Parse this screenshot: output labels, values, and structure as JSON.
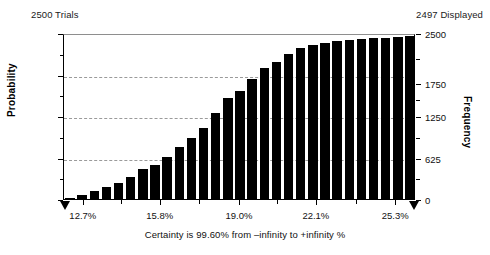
{
  "header": {
    "trials_label": "2500 Trials",
    "displayed_label": "2497 Displayed"
  },
  "axis_titles": {
    "left": "Probability",
    "right": "Frequency",
    "bottom": "Certainty is 99.60% from –infinity to +infinity %"
  },
  "chart_data": {
    "type": "bar",
    "title": "",
    "subtitle": "",
    "xlabel": "Certainty is 99.60% from –infinity to +infinity %",
    "ylabel": "Probability",
    "y2label": "Frequency",
    "grid": true,
    "legend": "none",
    "trials": 2500,
    "displayed": 2497,
    "certainty_percent": 99.6,
    "certainty_range": [
      "–infinity",
      "+infinity"
    ],
    "xlim": [
      11.9,
      26.1
    ],
    "xtick_labels": [
      "12.7%",
      "15.8%",
      "19.0%",
      "22.1%",
      "25.3%"
    ],
    "xtick_values": [
      12.7,
      15.8,
      19.0,
      22.1,
      25.3
    ],
    "ylim": [
      0.0,
      1.0
    ],
    "ytick_labels": [
      "0.000",
      "0.250",
      "0.500",
      "0.750",
      "1.000"
    ],
    "ytick_values": [
      0.0,
      0.25,
      0.5,
      0.75,
      1.0
    ],
    "y2lim": [
      0,
      2500
    ],
    "y2tick_labels": [
      "0",
      "625",
      "1250",
      "1750",
      "2500"
    ],
    "y2tick_values": [
      0,
      625,
      1250,
      1750,
      2500
    ],
    "categories": [
      "12.23%",
      "12.70%",
      "13.17%",
      "13.64%",
      "14.11%",
      "14.58%",
      "15.05%",
      "15.52%",
      "15.99%",
      "16.46%",
      "16.93%",
      "17.40%",
      "17.87%",
      "18.34%",
      "18.81%",
      "19.28%",
      "19.75%",
      "20.22%",
      "20.69%",
      "21.16%",
      "21.63%",
      "22.10%",
      "22.57%",
      "23.04%",
      "23.51%",
      "23.98%",
      "24.45%",
      "24.92%",
      "25.39%"
    ],
    "values": [
      0.004,
      0.026,
      0.048,
      0.072,
      0.097,
      0.131,
      0.18,
      0.203,
      0.256,
      0.311,
      0.37,
      0.428,
      0.516,
      0.608,
      0.653,
      0.722,
      0.79,
      0.826,
      0.876,
      0.908,
      0.925,
      0.942,
      0.953,
      0.96,
      0.964,
      0.969,
      0.972,
      0.976,
      0.98
    ],
    "frequency_values": [
      10,
      65,
      120,
      180,
      243,
      328,
      450,
      508,
      640,
      778,
      925,
      1070,
      1290,
      1520,
      1633,
      1805,
      1975,
      2065,
      2190,
      2270,
      2313,
      2355,
      2383,
      2400,
      2410,
      2423,
      2430,
      2440,
      2450
    ]
  }
}
